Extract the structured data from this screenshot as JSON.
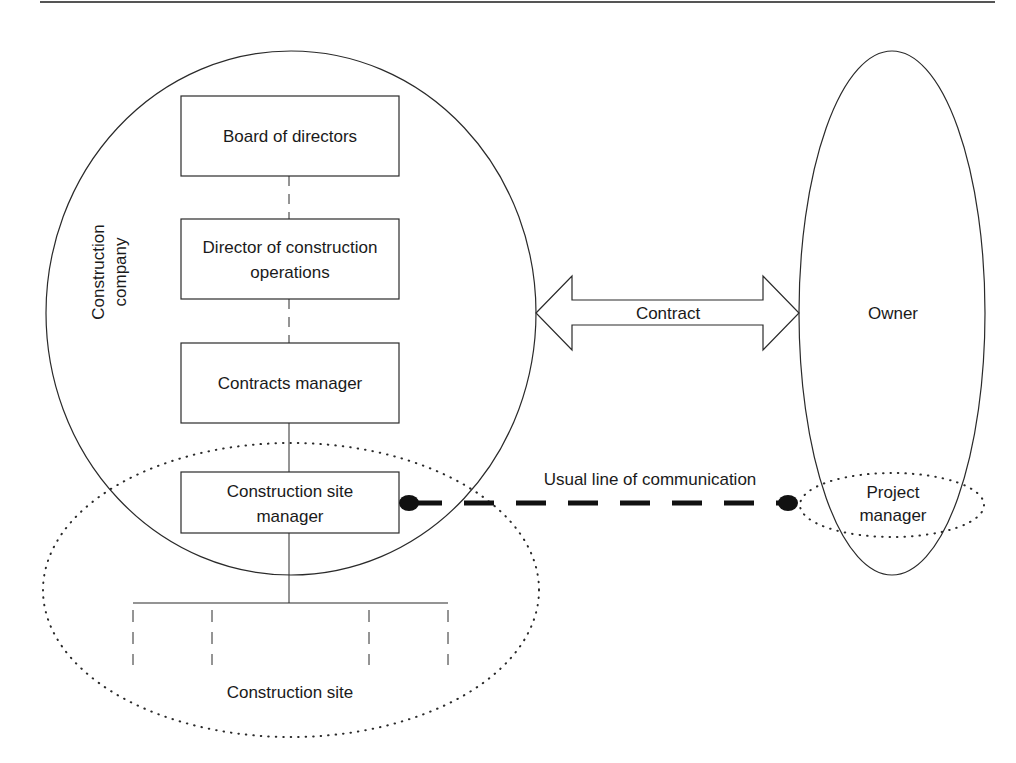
{
  "diagram": {
    "company": {
      "label_line1": "Construction",
      "label_line2": "company"
    },
    "hierarchy": [
      {
        "id": "board",
        "line1": "Board of directors",
        "line2": ""
      },
      {
        "id": "director",
        "line1": "Director of construction",
        "line2": "operations"
      },
      {
        "id": "contracts",
        "line1": "Contracts manager",
        "line2": ""
      },
      {
        "id": "site-manager",
        "line1": "Construction site",
        "line2": "manager"
      }
    ],
    "contract": {
      "label": "Contract"
    },
    "owner": {
      "label": "Owner"
    },
    "project_manager": {
      "line1": "Project",
      "line2": "manager"
    },
    "communication": {
      "label": "Usual line of communication"
    },
    "site": {
      "label": "Construction site"
    }
  },
  "colors": {
    "stroke": "#2a2a2a",
    "text": "#1a1a1a",
    "background": "#ffffff"
  }
}
